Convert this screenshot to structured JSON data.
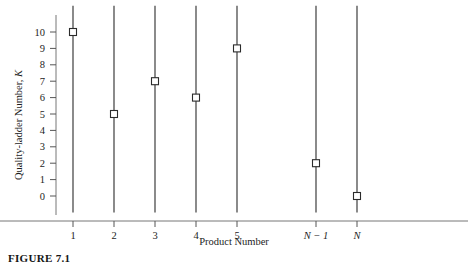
{
  "figure": {
    "caption": "FIGURE 7.1"
  },
  "chart_data": {
    "type": "scatter",
    "title": "",
    "xlabel": "Product Number",
    "ylabel": "Quality-ladder Number, K",
    "ylabel_plain": "Quality-ladder Number, ",
    "ylabel_italic": "K",
    "categories": [
      "1",
      "2",
      "3",
      "4",
      "5",
      "N − 1",
      "N"
    ],
    "category_styles": [
      "roman",
      "roman",
      "roman",
      "roman",
      "roman",
      "italic",
      "italic"
    ],
    "values": [
      10,
      5,
      7,
      6,
      9,
      2,
      0
    ],
    "stem_tops": [
      11.6,
      11.6,
      11.6,
      11.6,
      11.6,
      11.6,
      11.6
    ],
    "stem_bottoms": [
      -1.0,
      -1.0,
      -1.0,
      -1.0,
      -1.0,
      -1.0,
      -1.0
    ],
    "marker": "open-square",
    "ylim": [
      -1.0,
      11.9
    ],
    "xlim": [
      0.4,
      7.8
    ],
    "yticks": [
      0,
      1,
      2,
      3,
      4,
      5,
      6,
      7,
      8,
      9,
      10
    ],
    "ytick_labels": [
      "0",
      "1",
      "2",
      "3",
      "4",
      "5",
      "6",
      "7",
      "8",
      "9",
      "10"
    ],
    "grid": false,
    "legend": null,
    "colors": {
      "line": "#2b2b2b",
      "marker_edge": "#2b2b2b",
      "marker_fill": "#ffffff",
      "axis": "#555555",
      "text": "#1d1d1d"
    }
  }
}
